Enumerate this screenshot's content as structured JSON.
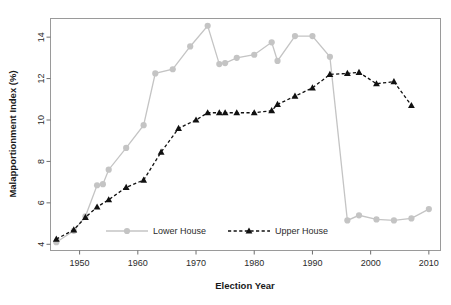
{
  "chart_data": {
    "type": "line",
    "title": "",
    "xlabel": "Election Year",
    "ylabel": "Malapportionment Index (%)",
    "xlim": [
      1945,
      2012
    ],
    "ylim": [
      3.7,
      14.9
    ],
    "xticks": [
      1950,
      1960,
      1970,
      1980,
      1990,
      2000,
      2010
    ],
    "yticks": [
      4,
      6,
      8,
      10,
      12,
      14
    ],
    "grid": false,
    "legend_position": "inside-bottom-center",
    "colors": {
      "lower_house": "#c4c4c4",
      "upper_house": "#111111",
      "frame": "#9a9a9a",
      "text": "#2b2b2b",
      "background": "#ffffff"
    },
    "series": [
      {
        "name": "Lower House",
        "marker": "circle",
        "line_style": "solid",
        "color": "#c4c4c4",
        "x": [
          1946,
          1949,
          1951,
          1953,
          1954,
          1955,
          1958,
          1961,
          1963,
          1966,
          1969,
          1972,
          1974,
          1975,
          1977,
          1980,
          1983,
          1984,
          1987,
          1990,
          1993,
          1996,
          1998,
          2001,
          2004,
          2007,
          2010
        ],
        "y": [
          4.1,
          4.65,
          5.35,
          6.85,
          6.9,
          7.6,
          8.65,
          9.75,
          12.25,
          12.45,
          13.55,
          14.55,
          12.7,
          12.75,
          13.0,
          13.15,
          13.75,
          12.85,
          14.05,
          14.05,
          13.05,
          5.15,
          5.4,
          5.2,
          5.15,
          5.25,
          5.7
        ]
      },
      {
        "name": "Upper House",
        "marker": "triangle",
        "line_style": "dashed",
        "color": "#111111",
        "x": [
          1946,
          1949,
          1951,
          1953,
          1955,
          1958,
          1961,
          1964,
          1967,
          1970,
          1972,
          1974,
          1975,
          1977,
          1980,
          1983,
          1984,
          1987,
          1990,
          1993,
          1996,
          1998,
          2001,
          2004,
          2007
        ],
        "y": [
          4.25,
          4.7,
          5.3,
          5.8,
          6.15,
          6.75,
          7.1,
          8.45,
          9.6,
          10.0,
          10.35,
          10.35,
          10.35,
          10.35,
          10.35,
          10.45,
          10.75,
          11.15,
          11.55,
          12.2,
          12.25,
          12.3,
          11.75,
          11.85,
          10.7
        ]
      }
    ]
  },
  "legend": {
    "items": [
      {
        "label": "Lower House",
        "marker": "circle",
        "style": "solid",
        "color": "#c4c4c4"
      },
      {
        "label": "Upper House",
        "marker": "triangle",
        "style": "dashed",
        "color": "#111111"
      }
    ]
  },
  "axes": {
    "x_tick_labels": [
      "1950",
      "1960",
      "1970",
      "1980",
      "1990",
      "2000",
      "2010"
    ],
    "y_tick_labels": [
      "4",
      "6",
      "8",
      "10",
      "12",
      "14"
    ]
  }
}
